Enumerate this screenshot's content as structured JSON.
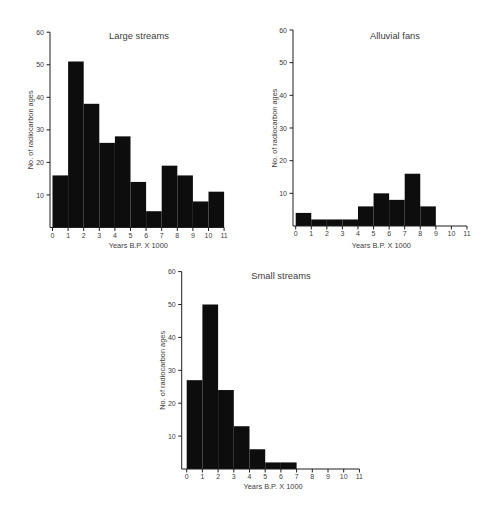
{
  "figure": {
    "background_color": "#ffffff",
    "bar_color": "#0d0d0d",
    "axis_color": "#1f1f1f",
    "text_color": "#3d3d3d"
  },
  "chart_data": [
    {
      "type": "bar",
      "title": "Large streams",
      "xlabel": "Years B.P. X 1000",
      "ylabel": "No. of radiocarbon ages",
      "bin_edges": [
        0,
        1,
        2,
        3,
        4,
        5,
        6,
        7,
        8,
        9,
        10,
        11
      ],
      "values": [
        16,
        51,
        38,
        26,
        28,
        14,
        5,
        19,
        16,
        8,
        11
      ],
      "x_ticks": [
        0,
        1,
        2,
        3,
        4,
        5,
        6,
        7,
        8,
        9,
        10,
        11
      ],
      "y_ticks": [
        10,
        20,
        30,
        40,
        50,
        60
      ],
      "xlim": [
        0,
        11
      ],
      "ylim": [
        0,
        60
      ],
      "grid": false,
      "legend": false
    },
    {
      "type": "bar",
      "title": "Alluvial fans",
      "xlabel": "Years B.P. X 1000",
      "ylabel": "No. of radiocarbon ages",
      "bin_edges": [
        0,
        1,
        2,
        3,
        4,
        5,
        6,
        7,
        8,
        9,
        10,
        11
      ],
      "values": [
        4,
        2,
        2,
        2,
        6,
        10,
        8,
        16,
        6,
        0,
        0
      ],
      "x_ticks": [
        0,
        1,
        2,
        3,
        4,
        5,
        6,
        7,
        8,
        9,
        10,
        11
      ],
      "y_ticks": [
        10,
        20,
        30,
        40,
        50,
        60
      ],
      "xlim": [
        0,
        11
      ],
      "ylim": [
        0,
        60
      ],
      "grid": false,
      "legend": false
    },
    {
      "type": "bar",
      "title": "Small streams",
      "xlabel": "Years B.P. X 1000",
      "ylabel": "No. of radiocarbon ages",
      "bin_edges": [
        0,
        1,
        2,
        3,
        4,
        5,
        6,
        7,
        8,
        9,
        10,
        11
      ],
      "values": [
        27,
        50,
        24,
        13,
        6,
        2,
        2,
        0,
        0,
        0,
        0
      ],
      "x_ticks": [
        0,
        1,
        2,
        3,
        4,
        5,
        6,
        7,
        8,
        9,
        10,
        11
      ],
      "y_ticks": [
        10,
        20,
        30,
        40,
        50,
        60
      ],
      "xlim": [
        0,
        11
      ],
      "ylim": [
        0,
        60
      ],
      "grid": false,
      "legend": false
    }
  ]
}
